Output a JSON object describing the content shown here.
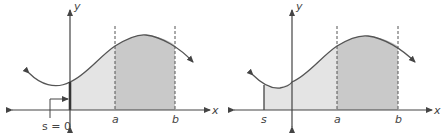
{
  "figure": {
    "colors": {
      "light_region": "#e4e4e4",
      "dark_region": "#c9c9c9",
      "curve": "#555555",
      "axes": "#444444"
    },
    "left_panel": {
      "x_axis_label": "x",
      "y_axis_label": "y",
      "marks": [
        "a",
        "b"
      ],
      "callout_label": "s = 0"
    },
    "right_panel": {
      "x_axis_label": "x",
      "y_axis_label": "y",
      "marks": [
        "s",
        "a",
        "b"
      ]
    }
  }
}
